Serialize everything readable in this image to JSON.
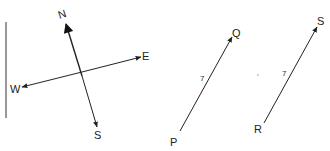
{
  "diagram": {
    "compass": {
      "labels": {
        "north": "N",
        "south": "S",
        "east": "E",
        "west": "W"
      }
    },
    "vector_pq": {
      "start_label": "P",
      "end_label": "Q",
      "tick_mark": "7"
    },
    "vector_rs": {
      "start_label": "R",
      "end_label": "S",
      "tick_mark": "7"
    },
    "colors": {
      "line": "#222222",
      "background": "#ffffff"
    }
  }
}
